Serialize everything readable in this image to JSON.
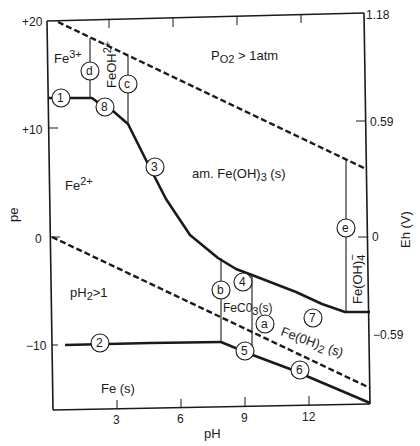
{
  "figure": {
    "type": "pe-pH (Pourbaix) diagram",
    "system": "Fe-H2O-CO2",
    "caption_visible_fragment": ""
  },
  "axes": {
    "x": {
      "title": "pH",
      "ticks": [
        {
          "value": 3,
          "label": "3"
        },
        {
          "value": 6,
          "label": "6"
        },
        {
          "value": 9,
          "label": "9"
        },
        {
          "value": 12,
          "label": "12"
        }
      ],
      "range": [
        0,
        14
      ]
    },
    "y_left": {
      "title": "pe",
      "ticks": [
        {
          "value": 20,
          "label": "+20"
        },
        {
          "value": 10,
          "label": "+10"
        },
        {
          "value": 0,
          "label": "0"
        },
        {
          "value": -10,
          "label": "−10"
        }
      ],
      "range": [
        -20,
        20
      ]
    },
    "y_right": {
      "title": "Eh (V)",
      "ticks": [
        {
          "value": 1.18,
          "label": "1.18"
        },
        {
          "value": 0.59,
          "label": "0.59"
        },
        {
          "value": 0,
          "label": "0"
        },
        {
          "value": -0.59,
          "label": "−0.59"
        }
      ]
    }
  },
  "regions": {
    "fe3": {
      "label": "Fe",
      "sup": "3+"
    },
    "feoh2": {
      "label": "FeOH",
      "sup": "2+"
    },
    "po2": {
      "label_pre": "P",
      "sub": "O2",
      "label_post": " > 1atm"
    },
    "fe2": {
      "label": "Fe",
      "sup": "2+"
    },
    "feoh3": {
      "label_pre": "am. Fe(OH)",
      "sub": "3",
      "label_post": " (s)"
    },
    "ph2": {
      "label_pre": "pH",
      "sub": "2",
      "label_post": ">1"
    },
    "feco3": {
      "label_pre": "FeC0",
      "sub": "3",
      "label_post": "(s)"
    },
    "feoh2s": {
      "label_pre": "Fe(0H)",
      "sub": "2",
      "label_post": " (s)"
    },
    "feoh4": {
      "label_pre": "Fe(OH)",
      "sub": "4",
      "sup": "−"
    },
    "fes": {
      "label": "Fe (s)"
    }
  },
  "line_markers": [
    {
      "id": "1",
      "label": "1"
    },
    {
      "id": "2",
      "label": "2"
    },
    {
      "id": "3",
      "label": "3"
    },
    {
      "id": "4",
      "label": "4"
    },
    {
      "id": "5",
      "label": "5"
    },
    {
      "id": "6",
      "label": "6"
    },
    {
      "id": "7",
      "label": "7"
    },
    {
      "id": "8",
      "label": "8"
    }
  ],
  "boundary_markers": [
    {
      "id": "a",
      "label": "a"
    },
    {
      "id": "b",
      "label": "b"
    },
    {
      "id": "c",
      "label": "c"
    },
    {
      "id": "d",
      "label": "d"
    },
    {
      "id": "e",
      "label": "e"
    }
  ],
  "colors": {
    "line": "#1a1a1a",
    "background": "#ffffff"
  }
}
